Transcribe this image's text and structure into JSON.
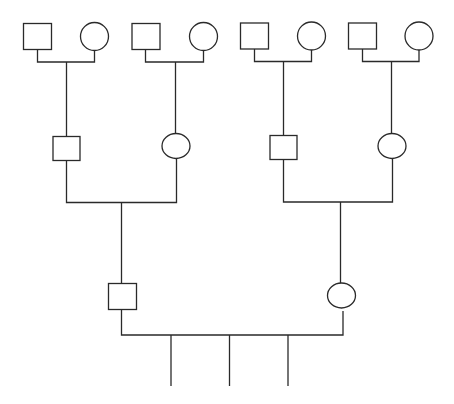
{
  "diagram": {
    "type": "pedigree",
    "legend": {
      "square": "male",
      "circle": "female"
    },
    "generations": [
      {
        "level": 1,
        "individuals": [
          {
            "id": "gg1",
            "sex": "male",
            "x": 37,
            "y": 36
          },
          {
            "id": "gg2",
            "sex": "female",
            "x": 94,
            "y": 36
          },
          {
            "id": "gg3",
            "sex": "male",
            "x": 145,
            "y": 36
          },
          {
            "id": "gg4",
            "sex": "female",
            "x": 203,
            "y": 36
          },
          {
            "id": "gg5",
            "sex": "male",
            "x": 254,
            "y": 36
          },
          {
            "id": "gg6",
            "sex": "female",
            "x": 311,
            "y": 36
          },
          {
            "id": "gg7",
            "sex": "male",
            "x": 362,
            "y": 36
          },
          {
            "id": "gg8",
            "sex": "female",
            "x": 419,
            "y": 36
          }
        ]
      },
      {
        "level": 2,
        "individuals": [
          {
            "id": "g1",
            "sex": "male",
            "x": 66,
            "y": 148
          },
          {
            "id": "g2",
            "sex": "female",
            "x": 176,
            "y": 146
          },
          {
            "id": "g3",
            "sex": "male",
            "x": 283,
            "y": 147
          },
          {
            "id": "g4",
            "sex": "female",
            "x": 392,
            "y": 146
          }
        ]
      },
      {
        "level": 3,
        "individuals": [
          {
            "id": "p1",
            "sex": "male",
            "x": 122,
            "y": 296
          },
          {
            "id": "p2",
            "sex": "female",
            "x": 342,
            "y": 295
          }
        ]
      },
      {
        "level": 4,
        "individuals": [
          {
            "id": "c1",
            "sex": "unspecified",
            "x": 171
          },
          {
            "id": "c2",
            "sex": "unspecified",
            "x": 229
          },
          {
            "id": "c3",
            "sex": "unspecified",
            "x": 288
          }
        ]
      }
    ],
    "unions": [
      {
        "partners": [
          "gg1",
          "gg2"
        ],
        "child": "g1"
      },
      {
        "partners": [
          "gg3",
          "gg4"
        ],
        "child": "g2"
      },
      {
        "partners": [
          "gg5",
          "gg6"
        ],
        "child": "g3"
      },
      {
        "partners": [
          "gg7",
          "gg8"
        ],
        "child": "g4"
      },
      {
        "partners": [
          "g1",
          "g2"
        ],
        "child": "p1"
      },
      {
        "partners": [
          "g3",
          "g4"
        ],
        "child": "p2"
      },
      {
        "partners": [
          "p1",
          "p2"
        ],
        "children": [
          "c1",
          "c2",
          "c3"
        ]
      }
    ],
    "colors": {
      "line": "#2a2a2a",
      "background": "#ffffff"
    }
  }
}
